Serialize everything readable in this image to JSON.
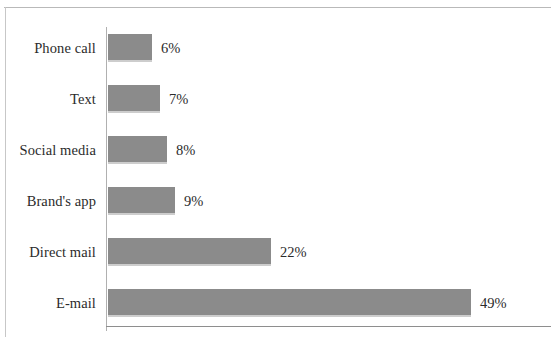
{
  "chart_data": {
    "type": "bar",
    "orientation": "horizontal",
    "title": "",
    "subtitle": "",
    "xlabel": "",
    "ylabel": "",
    "categories": [
      "Phone call",
      "Text",
      "Social media",
      "Brand's app",
      "Direct mail",
      "E-mail"
    ],
    "values": [
      6,
      7,
      8,
      9,
      22,
      49
    ],
    "value_labels": [
      "6%",
      "7%",
      "8%",
      "9%",
      "22%",
      "49%"
    ],
    "value_unit": "%",
    "xlim": [
      0,
      49
    ],
    "grid": false,
    "legend": false,
    "legend_position": "none",
    "series": [
      {
        "name": "Share of respondents",
        "values": [
          6,
          7,
          8,
          9,
          22,
          49
        ]
      }
    ],
    "bar_color": "#8b8b8b",
    "axis_color": "#8e8e8e",
    "label_color": "#2b2b2b",
    "background_color": "#ffffff"
  },
  "figure": {
    "frame_color": "#b9b9b9",
    "plot_left_px": 108,
    "px_per_unit": 7.4,
    "row_height_px": 30,
    "row_pitch_px": 51,
    "first_row_top_px": 33
  }
}
